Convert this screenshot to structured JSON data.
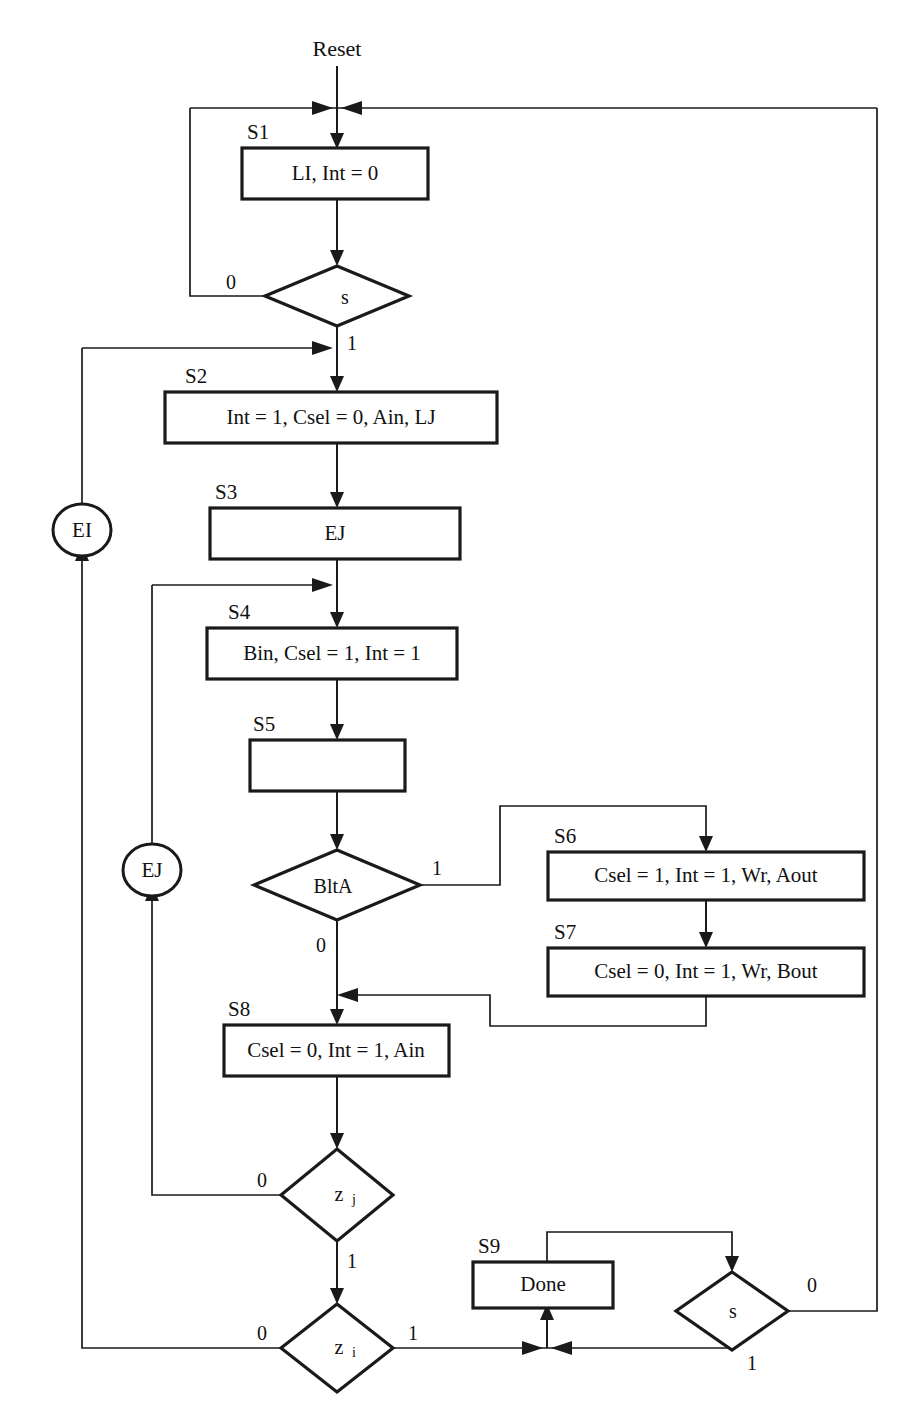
{
  "diagram": {
    "title": "Reset",
    "type": "asm-flowchart",
    "entry_label": "Reset",
    "colors": {
      "stroke": "#1a1a1a",
      "fill": "#ffffff",
      "text": "#111111"
    }
  },
  "states": [
    {
      "id": "S1",
      "label": "S1",
      "text": "LI, Int = 0"
    },
    {
      "id": "S2",
      "label": "S2",
      "text": "Int = 1, Csel = 0, Ain, LJ"
    },
    {
      "id": "S3",
      "label": "S3",
      "text": "EJ"
    },
    {
      "id": "S4",
      "label": "S4",
      "text": "Bin, Csel = 1, Int = 1"
    },
    {
      "id": "S5",
      "label": "S5",
      "text": ""
    },
    {
      "id": "S6",
      "label": "S6",
      "text": "Csel = 1, Int = 1, Wr, Aout"
    },
    {
      "id": "S7",
      "label": "S7",
      "text": "Csel = 0, Int = 1, Wr, Bout"
    },
    {
      "id": "S8",
      "label": "S8",
      "text": "Csel = 0, Int = 1, Ain"
    },
    {
      "id": "S9",
      "label": "S9",
      "text": "Done"
    }
  ],
  "decisions": [
    {
      "id": "d_s_top",
      "text": "s",
      "branches": [
        "0",
        "1"
      ]
    },
    {
      "id": "d_blta",
      "text": "BltA",
      "branches": [
        "1",
        "0"
      ]
    },
    {
      "id": "d_zj",
      "text": "z",
      "sub": "j",
      "branches": [
        "0",
        "1"
      ]
    },
    {
      "id": "d_zi",
      "text": "z",
      "sub": "i",
      "branches": [
        "0",
        "1"
      ]
    },
    {
      "id": "d_s_bottom",
      "text": "s",
      "branches": [
        "0",
        "1"
      ]
    }
  ],
  "connectors": [
    {
      "id": "EI",
      "text": "EI"
    },
    {
      "id": "EJ",
      "text": "EJ"
    }
  ],
  "edge_labels": {
    "s_top_zero": "0",
    "s_top_one": "1",
    "blta_one": "1",
    "blta_zero": "0",
    "zj_zero": "0",
    "zj_one": "1",
    "zi_zero": "0",
    "zi_one": "1",
    "s_bottom_zero": "0",
    "s_bottom_one": "1"
  }
}
